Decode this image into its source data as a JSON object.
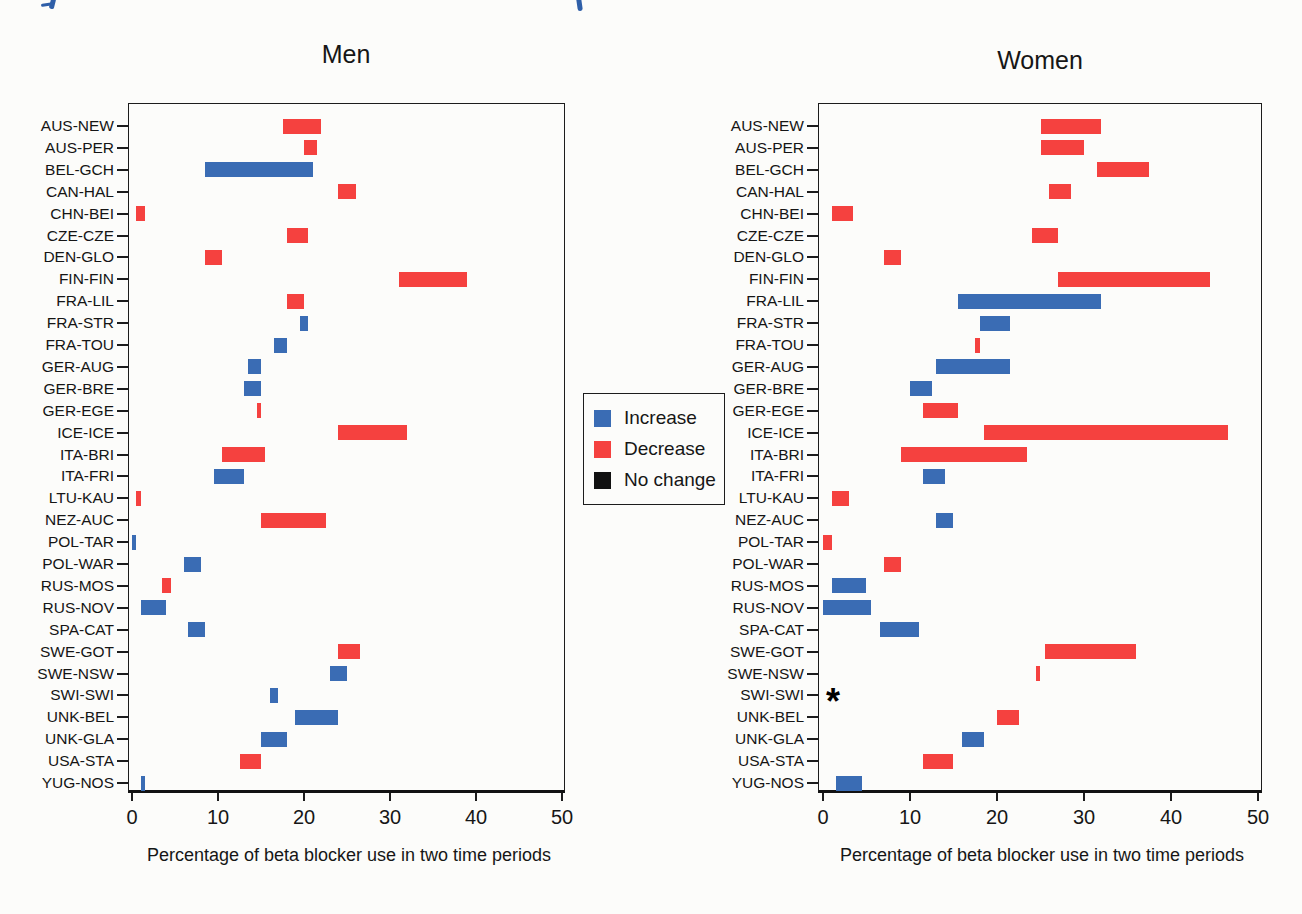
{
  "figure": {
    "artifacts": {
      "cropped_blue_heading_color": "#2F5FA8"
    },
    "legend": {
      "items": [
        {
          "label": "Increase",
          "color": "#3A6CB4"
        },
        {
          "label": "Decrease",
          "color": "#F5413F"
        },
        {
          "label": "No change",
          "color": "#111111"
        }
      ],
      "position": "center-between-panels"
    },
    "colors": {
      "increase": "#3A6CB4",
      "decrease": "#F5413F",
      "no_change": "#111111"
    }
  },
  "chart_data": [
    {
      "type": "bar",
      "subtype": "floating-range-horizontal",
      "title": "Men",
      "xlabel": "Percentage of beta blocker use in two time periods",
      "xlim": [
        0,
        50
      ],
      "x_ticks": [
        0,
        10,
        20,
        30,
        40,
        50
      ],
      "grid": false,
      "categories": [
        "AUS-NEW",
        "AUS-PER",
        "BEL-GCH",
        "CAN-HAL",
        "CHN-BEI",
        "CZE-CZE",
        "DEN-GLO",
        "FIN-FIN",
        "FRA-LIL",
        "FRA-STR",
        "FRA-TOU",
        "GER-AUG",
        "GER-BRE",
        "GER-EGE",
        "ICE-ICE",
        "ITA-BRI",
        "ITA-FRI",
        "LTU-KAU",
        "NEZ-AUC",
        "POL-TAR",
        "POL-WAR",
        "RUS-MOS",
        "RUS-NOV",
        "SPA-CAT",
        "SWE-GOT",
        "SWE-NSW",
        "SWI-SWI",
        "UNK-BEL",
        "UNK-GLA",
        "USA-STA",
        "YUG-NOS"
      ],
      "bars": [
        {
          "category": "AUS-NEW",
          "low": 17.5,
          "high": 22,
          "change": "decrease"
        },
        {
          "category": "AUS-PER",
          "low": 20,
          "high": 21.5,
          "change": "decrease"
        },
        {
          "category": "BEL-GCH",
          "low": 8.5,
          "high": 21,
          "change": "increase"
        },
        {
          "category": "CAN-HAL",
          "low": 24,
          "high": 26,
          "change": "decrease"
        },
        {
          "category": "CHN-BEI",
          "low": 0.5,
          "high": 1.5,
          "change": "decrease"
        },
        {
          "category": "CZE-CZE",
          "low": 18,
          "high": 20.5,
          "change": "decrease"
        },
        {
          "category": "DEN-GLO",
          "low": 8.5,
          "high": 10.5,
          "change": "decrease"
        },
        {
          "category": "FIN-FIN",
          "low": 31,
          "high": 39,
          "change": "decrease"
        },
        {
          "category": "FRA-LIL",
          "low": 18,
          "high": 20,
          "change": "decrease"
        },
        {
          "category": "FRA-STR",
          "low": 19.5,
          "high": 20.5,
          "change": "increase"
        },
        {
          "category": "FRA-TOU",
          "low": 16.5,
          "high": 18,
          "change": "increase"
        },
        {
          "category": "GER-AUG",
          "low": 13.5,
          "high": 15,
          "change": "increase"
        },
        {
          "category": "GER-BRE",
          "low": 13,
          "high": 15,
          "change": "increase"
        },
        {
          "category": "GER-EGE",
          "low": 14.5,
          "high": 15,
          "change": "decrease"
        },
        {
          "category": "ICE-ICE",
          "low": 24,
          "high": 32,
          "change": "decrease"
        },
        {
          "category": "ITA-BRI",
          "low": 10.5,
          "high": 15.5,
          "change": "decrease"
        },
        {
          "category": "ITA-FRI",
          "low": 9.5,
          "high": 13,
          "change": "increase"
        },
        {
          "category": "LTU-KAU",
          "low": 0.5,
          "high": 1,
          "change": "decrease"
        },
        {
          "category": "NEZ-AUC",
          "low": 15,
          "high": 22.5,
          "change": "decrease"
        },
        {
          "category": "POL-TAR",
          "low": 0,
          "high": 0.5,
          "change": "increase"
        },
        {
          "category": "POL-WAR",
          "low": 6,
          "high": 8,
          "change": "increase"
        },
        {
          "category": "RUS-MOS",
          "low": 3.5,
          "high": 4.5,
          "change": "decrease"
        },
        {
          "category": "RUS-NOV",
          "low": 1,
          "high": 4,
          "change": "increase"
        },
        {
          "category": "SPA-CAT",
          "low": 6.5,
          "high": 8.5,
          "change": "increase"
        },
        {
          "category": "SWE-GOT",
          "low": 24,
          "high": 26.5,
          "change": "decrease"
        },
        {
          "category": "SWE-NSW",
          "low": 23,
          "high": 25,
          "change": "increase"
        },
        {
          "category": "SWI-SWI",
          "low": 16,
          "high": 17,
          "change": "increase"
        },
        {
          "category": "UNK-BEL",
          "low": 19,
          "high": 24,
          "change": "increase"
        },
        {
          "category": "UNK-GLA",
          "low": 15,
          "high": 18,
          "change": "increase"
        },
        {
          "category": "USA-STA",
          "low": 12.5,
          "high": 15,
          "change": "decrease"
        },
        {
          "category": "YUG-NOS",
          "low": 1,
          "high": 1.5,
          "change": "increase"
        }
      ]
    },
    {
      "type": "bar",
      "subtype": "floating-range-horizontal",
      "title": "Women",
      "xlabel": "Percentage of beta blocker use in two time periods",
      "xlim": [
        0,
        50
      ],
      "x_ticks": [
        0,
        10,
        20,
        30,
        40,
        50
      ],
      "grid": false,
      "categories": [
        "AUS-NEW",
        "AUS-PER",
        "BEL-GCH",
        "CAN-HAL",
        "CHN-BEI",
        "CZE-CZE",
        "DEN-GLO",
        "FIN-FIN",
        "FRA-LIL",
        "FRA-STR",
        "FRA-TOU",
        "GER-AUG",
        "GER-BRE",
        "GER-EGE",
        "ICE-ICE",
        "ITA-BRI",
        "ITA-FRI",
        "LTU-KAU",
        "NEZ-AUC",
        "POL-TAR",
        "POL-WAR",
        "RUS-MOS",
        "RUS-NOV",
        "SPA-CAT",
        "SWE-GOT",
        "SWE-NSW",
        "SWI-SWI",
        "UNK-BEL",
        "UNK-GLA",
        "USA-STA",
        "YUG-NOS"
      ],
      "bars": [
        {
          "category": "AUS-NEW",
          "low": 25,
          "high": 32,
          "change": "decrease"
        },
        {
          "category": "AUS-PER",
          "low": 25,
          "high": 30,
          "change": "decrease"
        },
        {
          "category": "BEL-GCH",
          "low": 31.5,
          "high": 37.5,
          "change": "decrease"
        },
        {
          "category": "CAN-HAL",
          "low": 26,
          "high": 28.5,
          "change": "decrease"
        },
        {
          "category": "CHN-BEI",
          "low": 1,
          "high": 3.5,
          "change": "decrease"
        },
        {
          "category": "CZE-CZE",
          "low": 24,
          "high": 27,
          "change": "decrease"
        },
        {
          "category": "DEN-GLO",
          "low": 7,
          "high": 9,
          "change": "decrease"
        },
        {
          "category": "FIN-FIN",
          "low": 27,
          "high": 44.5,
          "change": "decrease"
        },
        {
          "category": "FRA-LIL",
          "low": 15.5,
          "high": 32,
          "change": "increase"
        },
        {
          "category": "FRA-STR",
          "low": 18,
          "high": 21.5,
          "change": "increase"
        },
        {
          "category": "FRA-TOU",
          "low": 17.5,
          "high": 18,
          "change": "decrease"
        },
        {
          "category": "GER-AUG",
          "low": 13,
          "high": 21.5,
          "change": "increase"
        },
        {
          "category": "GER-BRE",
          "low": 10,
          "high": 12.5,
          "change": "increase"
        },
        {
          "category": "GER-EGE",
          "low": 11.5,
          "high": 15.5,
          "change": "decrease"
        },
        {
          "category": "ICE-ICE",
          "low": 18.5,
          "high": 46.5,
          "change": "decrease"
        },
        {
          "category": "ITA-BRI",
          "low": 9,
          "high": 23.5,
          "change": "decrease"
        },
        {
          "category": "ITA-FRI",
          "low": 11.5,
          "high": 14,
          "change": "increase"
        },
        {
          "category": "LTU-KAU",
          "low": 1,
          "high": 3,
          "change": "decrease"
        },
        {
          "category": "NEZ-AUC",
          "low": 13,
          "high": 15,
          "change": "increase"
        },
        {
          "category": "POL-TAR",
          "low": 0,
          "high": 1,
          "change": "decrease"
        },
        {
          "category": "POL-WAR",
          "low": 7,
          "high": 9,
          "change": "decrease"
        },
        {
          "category": "RUS-MOS",
          "low": 1,
          "high": 5,
          "change": "increase"
        },
        {
          "category": "RUS-NOV",
          "low": 0,
          "high": 5.5,
          "change": "increase"
        },
        {
          "category": "SPA-CAT",
          "low": 6.5,
          "high": 11,
          "change": "increase"
        },
        {
          "category": "SWE-GOT",
          "low": 25.5,
          "high": 36,
          "change": "decrease"
        },
        {
          "category": "SWE-NSW",
          "low": 24.5,
          "high": 25,
          "change": "decrease"
        },
        {
          "category": "SWI-SWI",
          "low": null,
          "high": null,
          "change": "no-data",
          "marker": "*"
        },
        {
          "category": "UNK-BEL",
          "low": 20,
          "high": 22.5,
          "change": "decrease"
        },
        {
          "category": "UNK-GLA",
          "low": 16,
          "high": 18.5,
          "change": "increase"
        },
        {
          "category": "USA-STA",
          "low": 11.5,
          "high": 15,
          "change": "decrease"
        },
        {
          "category": "YUG-NOS",
          "low": 1.5,
          "high": 4.5,
          "change": "increase"
        }
      ]
    }
  ]
}
